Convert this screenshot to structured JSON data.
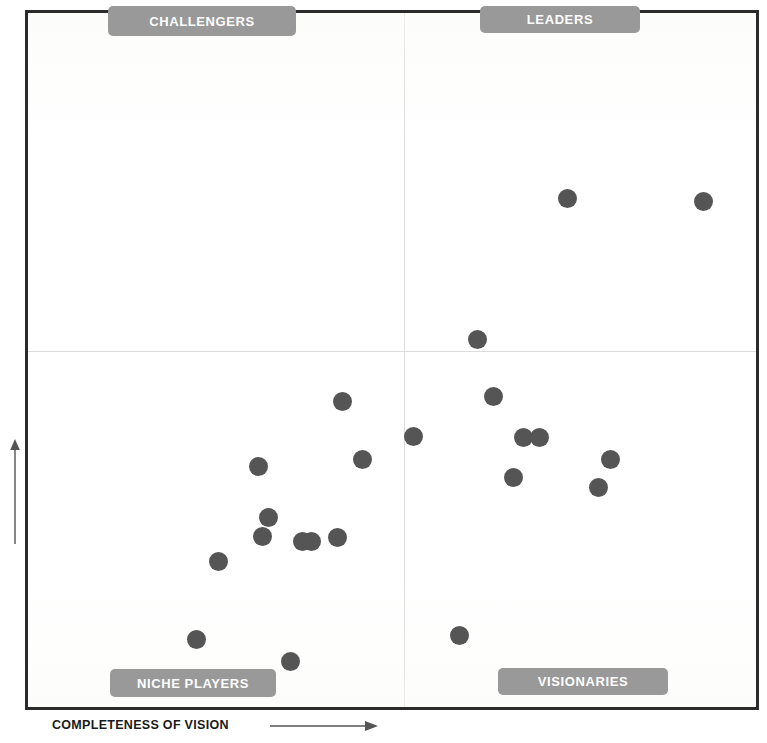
{
  "figure": {
    "quadrant_labels": {
      "top_left": "CHALLENGERS",
      "top_right": "LEADERS",
      "bottom_left": "NICHE PLAYERS",
      "bottom_right": "VISIONARIES"
    },
    "axes": {
      "x_label": "COMPLETENESS OF VISION",
      "y_label": "ABILITY TO EXECUTE",
      "x_arrow_icon": "right-arrow-icon",
      "y_arrow_icon": "up-arrow-icon"
    },
    "colors": {
      "dot": "#555555",
      "label_pill_background": "#999999",
      "label_pill_text": "#ffffff",
      "frame_border": "#2b2b2b",
      "divider": "#dcdcdc",
      "background": "#ffffff"
    }
  },
  "chart_data": {
    "type": "scatter",
    "xlabel": "COMPLETENESS OF VISION",
    "ylabel": "ABILITY TO EXECUTE",
    "xlim": [
      0,
      100
    ],
    "ylim": [
      0,
      100
    ],
    "grid": false,
    "legend": null,
    "quadrant_split": {
      "x": 51.6,
      "y": 51.3
    },
    "quadrants": [
      "CHALLENGERS",
      "LEADERS",
      "NICHE PLAYERS",
      "VISIONARIES"
    ],
    "points": [
      {
        "x": 74.1,
        "y": 73.3,
        "quadrant": "LEADERS"
      },
      {
        "x": 92.8,
        "y": 72.9,
        "quadrant": "LEADERS"
      },
      {
        "x": 61.7,
        "y": 53.0,
        "quadrant": "LEADERS"
      },
      {
        "x": 63.9,
        "y": 44.7,
        "quadrant": "VISIONARIES"
      },
      {
        "x": 68.1,
        "y": 38.9,
        "quadrant": "VISIONARIES"
      },
      {
        "x": 70.2,
        "y": 38.9,
        "quadrant": "VISIONARIES"
      },
      {
        "x": 80.0,
        "y": 35.7,
        "quadrant": "VISIONARIES"
      },
      {
        "x": 66.7,
        "y": 33.0,
        "quadrant": "VISIONARIES"
      },
      {
        "x": 78.3,
        "y": 31.7,
        "quadrant": "VISIONARIES"
      },
      {
        "x": 59.3,
        "y": 10.3,
        "quadrant": "VISIONARIES"
      },
      {
        "x": 43.2,
        "y": 44.0,
        "quadrant": "NICHE PLAYERS"
      },
      {
        "x": 52.9,
        "y": 39.0,
        "quadrant": "VISIONARIES"
      },
      {
        "x": 45.9,
        "y": 35.6,
        "quadrant": "NICHE PLAYERS"
      },
      {
        "x": 31.7,
        "y": 34.6,
        "quadrant": "NICHE PLAYERS"
      },
      {
        "x": 33.1,
        "y": 27.3,
        "quadrant": "NICHE PLAYERS"
      },
      {
        "x": 32.2,
        "y": 24.6,
        "quadrant": "NICHE PLAYERS"
      },
      {
        "x": 37.7,
        "y": 23.9,
        "quadrant": "NICHE PLAYERS"
      },
      {
        "x": 39.0,
        "y": 23.9,
        "quadrant": "NICHE PLAYERS"
      },
      {
        "x": 42.5,
        "y": 24.4,
        "quadrant": "NICHE PLAYERS"
      },
      {
        "x": 26.2,
        "y": 21.0,
        "quadrant": "NICHE PLAYERS"
      },
      {
        "x": 23.1,
        "y": 9.7,
        "quadrant": "NICHE PLAYERS"
      },
      {
        "x": 22.0,
        "y": 3.9,
        "quadrant": "NICHE PLAYERS"
      },
      {
        "x": 36.0,
        "y": 6.6,
        "quadrant": "NICHE PLAYERS"
      }
    ]
  }
}
